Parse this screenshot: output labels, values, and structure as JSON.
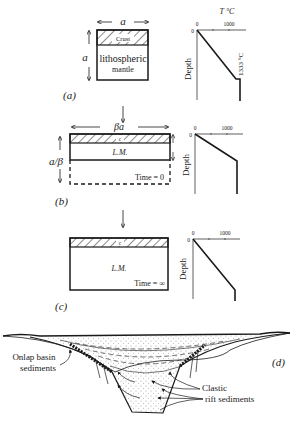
{
  "figure": {
    "panels": [
      {
        "id": "a",
        "label": "(a)",
        "width_label": "a",
        "height_label": "a",
        "layers": {
          "crust": "Crust",
          "mantle_line1": "lithospheric",
          "mantle_line2": "mantle"
        },
        "geotherm": {
          "x_axis_title": "T °C",
          "x_ticks": [
            "0",
            "1000"
          ],
          "y_origin": "0",
          "y_axis_title": "Depth",
          "annotation": "1333 °C"
        }
      },
      {
        "id": "b",
        "label": "(b)",
        "width_label": "βa",
        "height_label": "a/β",
        "layers": {
          "crust": "c",
          "mantle": "L.M."
        },
        "time_label": "Time = 0",
        "geotherm": {
          "x_ticks": [
            "0",
            "1000"
          ],
          "y_origin": "0",
          "y_axis_title": "Depth"
        }
      },
      {
        "id": "c",
        "label": "(c)",
        "layers": {
          "crust": "c",
          "mantle": "L.M."
        },
        "time_label": "Time = ∞",
        "geotherm": {
          "x_ticks": [
            "0",
            "1000"
          ],
          "y_origin": "0",
          "y_axis_title": "Depth"
        }
      },
      {
        "id": "d",
        "label": "(d)",
        "annotations": {
          "onlap_line1": "Onlap basin",
          "onlap_line2": "sediments",
          "clastic_line1": "Clastic",
          "clastic_line2": "rift sediments"
        }
      }
    ],
    "colors": {
      "ink": "#1a1a1a",
      "background": "#ffffff"
    }
  }
}
